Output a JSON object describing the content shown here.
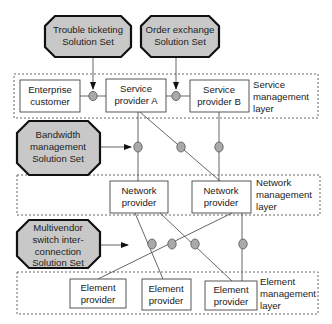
{
  "layers": {
    "service": {
      "label": [
        "Service",
        "management",
        "layer"
      ]
    },
    "network": {
      "label": [
        "Network",
        "management",
        "layer"
      ]
    },
    "element": {
      "label": [
        "Element",
        "management",
        "layer"
      ]
    }
  },
  "solution_sets": {
    "trouble": {
      "lines": [
        "Trouble ticketing",
        "Solution Set"
      ]
    },
    "order": {
      "lines": [
        "Order exchange",
        "Solution Set"
      ]
    },
    "bandwidth": {
      "lines": [
        "Bandwidth",
        "management",
        "Solution Set"
      ]
    },
    "multivendor": {
      "lines": [
        "Multivendor",
        "switch inter-",
        "connection",
        "Solution Set"
      ]
    }
  },
  "boxes": {
    "enterprise": {
      "lines": [
        "Enterprise",
        "customer"
      ]
    },
    "service_a": {
      "lines": [
        "Service",
        "provider A"
      ]
    },
    "service_b": {
      "lines": [
        "Service",
        "provider B"
      ]
    },
    "network_1": {
      "lines": [
        "Network",
        "provider"
      ]
    },
    "network_2": {
      "lines": [
        "Network",
        "provider"
      ]
    },
    "element_1": {
      "lines": [
        "Element",
        "provider"
      ]
    },
    "element_2": {
      "lines": [
        "Element",
        "provider"
      ]
    },
    "element_3": {
      "lines": [
        "Element",
        "provider"
      ]
    }
  },
  "colors": {
    "octagon_fill": "#c8c8c8",
    "octagon_stroke": "#111111",
    "node_fill": "#a9a9a9",
    "line": "#555555",
    "layer_border": "#666666"
  }
}
